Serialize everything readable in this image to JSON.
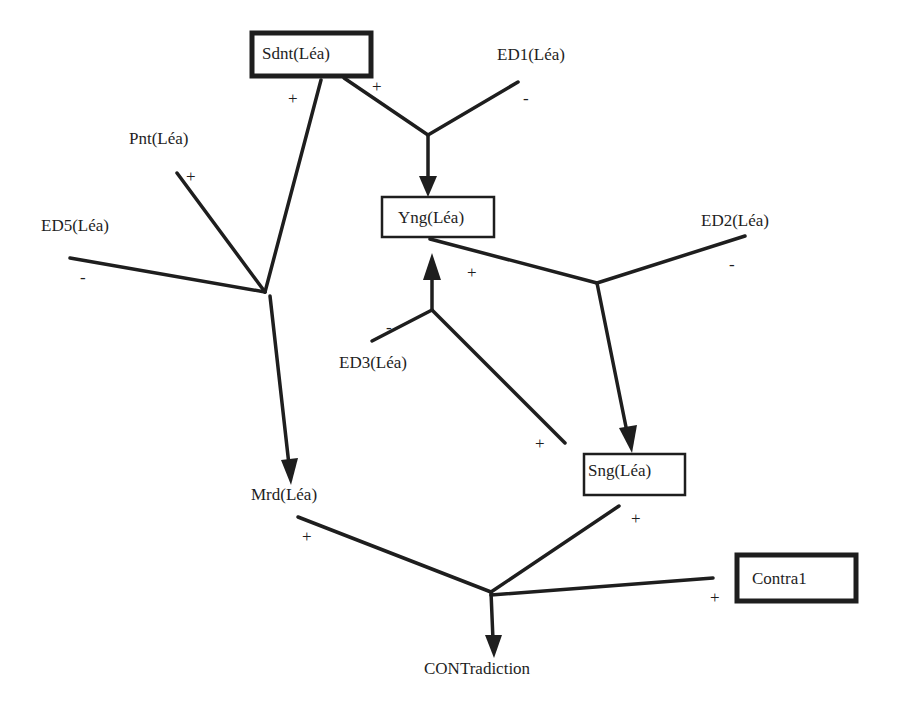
{
  "diagram": {
    "nodes": {
      "sdnt": {
        "label": "Sdnt(Léa)",
        "boxed": "thick"
      },
      "ed1": {
        "label": "ED1(Léa)",
        "boxed": "none"
      },
      "pnt": {
        "label": "Pnt(Léa)",
        "boxed": "none"
      },
      "ed5": {
        "label": "ED5(Léa)",
        "boxed": "none"
      },
      "yng": {
        "label": "Yng(Léa)",
        "boxed": "thin"
      },
      "ed2": {
        "label": "ED2(Léa)",
        "boxed": "none"
      },
      "ed3": {
        "label": "ED3(Léa)",
        "boxed": "none"
      },
      "sng": {
        "label": "Sng(Léa)",
        "boxed": "thin"
      },
      "mrd": {
        "label": "Mrd(Léa)",
        "boxed": "none"
      },
      "contra1": {
        "label": "Contra1",
        "boxed": "thick"
      },
      "contradiction": {
        "label": "CONTradiction",
        "boxed": "none"
      }
    },
    "signs": {
      "sdnt_to_mrd": "+",
      "sdnt_to_yng": "+",
      "ed1_to_yng": "-",
      "pnt_to_mrd": "+",
      "ed5_to_mrd": "-",
      "yng_to_sng": "+",
      "ed2_to_sng": "-",
      "ed3_to_yng": "-",
      "sng_to_yng": "+",
      "mrd_to_contra": "+",
      "sng_to_contra": "+",
      "contra1_to_contra": "+"
    },
    "junctions": [
      {
        "id": "j_yng",
        "inputs": [
          "Sdnt(Léa) +",
          "ED1(Léa) -"
        ],
        "output": "Yng(Léa)"
      },
      {
        "id": "j_mrd",
        "inputs": [
          "Sdnt(Léa) +",
          "Pnt(Léa) +",
          "ED5(Léa) -"
        ],
        "output": "Mrd(Léa)"
      },
      {
        "id": "j_sng",
        "inputs": [
          "Yng(Léa) +",
          "ED2(Léa) -"
        ],
        "output": "Sng(Léa)"
      },
      {
        "id": "j_yng2",
        "inputs": [
          "ED3(Léa) -",
          "Sng(Léa) +"
        ],
        "output": "Yng(Léa)"
      },
      {
        "id": "j_contra",
        "inputs": [
          "Mrd(Léa) +",
          "Sng(Léa) +",
          "Contra1 +"
        ],
        "output": "CONTradiction"
      }
    ]
  }
}
